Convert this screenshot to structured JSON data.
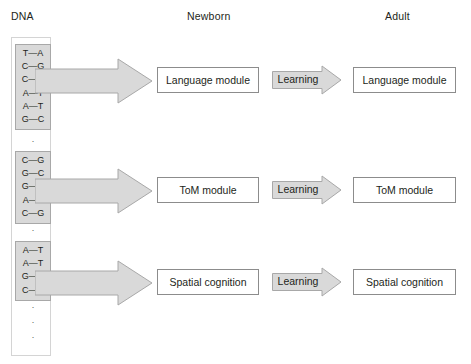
{
  "headers": {
    "dna": "DNA",
    "newborn": "Newborn",
    "adult": "Adult"
  },
  "colors": {
    "gene_block_fill": "#d9d9d9",
    "gene_block_stroke": "#a8a8a8",
    "arrow_fill": "#d9d9d9",
    "arrow_stroke": "#a8a8a8",
    "box_stroke": "#8c8c8c",
    "text": "#231f20"
  },
  "dna": {
    "column_label": "DNA",
    "gene_blocks": [
      {
        "id": "gene-block-1",
        "base_pairs": [
          "T—A",
          "C—G",
          "C—G",
          "A—T",
          "A—T",
          "G—C"
        ]
      },
      {
        "id": "gene-block-2",
        "base_pairs": [
          "C—G",
          "G—C",
          "G—C",
          "A—T",
          "C—G"
        ]
      },
      {
        "id": "gene-block-3",
        "base_pairs": [
          "A—T",
          "A—T",
          "G—C",
          "C—C"
        ]
      }
    ],
    "ellipses": [
      {
        "id": "dots-1",
        "dots": [
          "·",
          "·"
        ]
      },
      {
        "id": "dots-2",
        "dots": [
          "·",
          "·"
        ]
      },
      {
        "id": "dots-3",
        "dots": [
          "·",
          "·",
          "·"
        ]
      }
    ]
  },
  "rows": [
    {
      "newborn_module": "Language module",
      "transition_label": "Learning",
      "adult_module": "Language module"
    },
    {
      "newborn_module": "ToM module",
      "transition_label": "Learning",
      "adult_module": "ToM module"
    },
    {
      "newborn_module": "Spatial cognition",
      "transition_label": "Learning",
      "adult_module": "Spatial cognition"
    }
  ]
}
